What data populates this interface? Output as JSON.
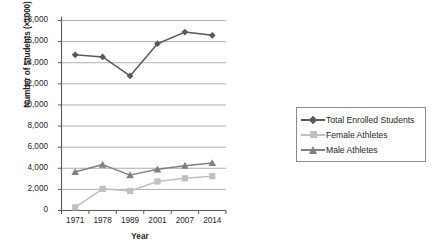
{
  "chart_data": {
    "type": "line",
    "title": "",
    "xlabel": "Year",
    "ylabel": "Number of Students (×1000)",
    "categories": [
      "1971",
      "1978",
      "1989",
      "2001",
      "2007",
      "2014"
    ],
    "ylim": [
      0,
      18000
    ],
    "ytick_labels": [
      "18,000",
      "16,000",
      "14,000",
      "12,000",
      "10,000",
      "8,000",
      "6,000",
      "4,000",
      "2,000",
      "0"
    ],
    "ytick_values": [
      18000,
      16000,
      14000,
      12000,
      10000,
      8000,
      6000,
      4000,
      2000,
      0
    ],
    "grid": true,
    "legend_position": "right",
    "series": [
      {
        "name": "Total Enrolled Students",
        "color": "#595959",
        "marker": "diamond",
        "values": [
          14750,
          14550,
          12750,
          15800,
          16900,
          16600
        ]
      },
      {
        "name": "Female Athletes",
        "color": "#bfbfbf",
        "marker": "square",
        "values": [
          300,
          2050,
          1850,
          2750,
          3050,
          3250
        ]
      },
      {
        "name": "Male Athletes",
        "color": "#808080",
        "marker": "triangle",
        "values": [
          3650,
          4350,
          3350,
          3900,
          4250,
          4500
        ]
      }
    ]
  },
  "colors": {
    "axis": "#595959",
    "grid": "#a6a6a6",
    "text": "#231f20",
    "legend_border": "#8c8c8c",
    "background": "#ffffff"
  }
}
